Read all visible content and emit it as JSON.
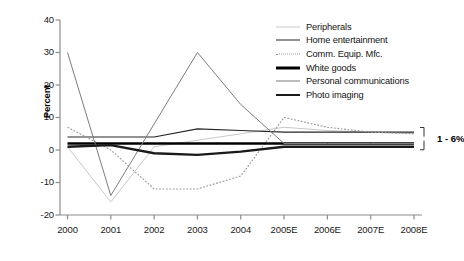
{
  "chart_data": {
    "type": "line",
    "title": "",
    "subtitle": "",
    "xlabel": "",
    "ylabel": "Percent",
    "grid": false,
    "legend_position": "top-right",
    "x": [
      "2000",
      "2001",
      "2002",
      "2003",
      "2004",
      "2005E",
      "2006E",
      "2007E",
      "2008E"
    ],
    "xtick_labels": [
      "2000",
      "2001",
      "2002",
      "2003",
      "2004",
      "2005E",
      "2006E",
      "2007E",
      "2008E"
    ],
    "ytick_labels": [
      "40",
      "30",
      "20",
      "10",
      "0",
      "-10",
      "-20"
    ],
    "ytick_values": [
      40,
      30,
      20,
      10,
      0,
      -10,
      -20
    ],
    "ylim": [
      -20,
      40
    ],
    "annotations": [
      {
        "text": "1 - 6%",
        "kind": "bracket-range",
        "at_x": "2008E",
        "range": [
          1,
          6
        ]
      }
    ],
    "series": [
      {
        "name": "Peripherals",
        "color": "#c9c9c9",
        "width": 1.0,
        "dash": "none",
        "values": [
          1,
          -16,
          1,
          3,
          5,
          7,
          6,
          5.5,
          5
        ]
      },
      {
        "name": "Home entertainment",
        "color": "#262626",
        "width": 1.2,
        "dash": "none",
        "values": [
          4,
          4,
          4,
          6.5,
          6,
          5.5,
          5.5,
          5.5,
          5.5
        ]
      },
      {
        "name": "Comm. Equip. Mfc.",
        "color": "#999999",
        "width": 1.1,
        "dash": "dotted",
        "values": [
          7,
          0,
          -12,
          -12,
          -8,
          10,
          7,
          5.5,
          5
        ]
      },
      {
        "name": "White goods",
        "color": "#000000",
        "width": 2.6,
        "dash": "none",
        "values": [
          2,
          2,
          2,
          2,
          2,
          2,
          2,
          2,
          2
        ]
      },
      {
        "name": "Personal communications",
        "color": "#7d7d7d",
        "width": 1.0,
        "dash": "none",
        "values": [
          30,
          -14,
          8,
          30,
          14,
          2,
          2,
          2,
          2
        ]
      },
      {
        "name": "Photo imaging",
        "color": "#1a1a1a",
        "width": 2.4,
        "dash": "none",
        "values": [
          1,
          1.5,
          -1,
          -1.5,
          -0.5,
          1,
          1,
          1,
          1
        ]
      }
    ]
  },
  "legend": {
    "items": [
      {
        "label": "Peripherals"
      },
      {
        "label": "Home entertainment"
      },
      {
        "label": "Comm. Equip. Mfc."
      },
      {
        "label": "White goods"
      },
      {
        "label": "Personal communications"
      },
      {
        "label": "Photo imaging"
      }
    ]
  },
  "axes": {
    "y_title": "Percent"
  }
}
